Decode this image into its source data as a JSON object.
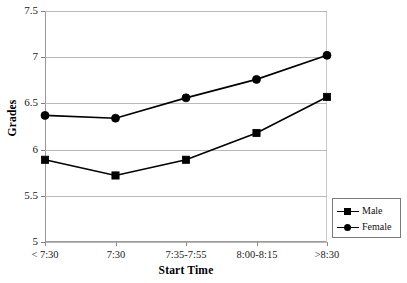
{
  "chart_data": {
    "type": "line",
    "title": "",
    "xlabel": "Start Time",
    "ylabel": "Grades",
    "categories": [
      "< 7:30",
      "7:30",
      "7:35-7:55",
      "8:00-8:15",
      ">8:30"
    ],
    "series": [
      {
        "name": "Male",
        "marker": "square",
        "color": "#000000",
        "values": [
          5.89,
          5.72,
          5.89,
          6.18,
          6.57
        ]
      },
      {
        "name": "Female",
        "marker": "circle",
        "color": "#000000",
        "values": [
          6.37,
          6.34,
          6.56,
          6.76,
          7.02
        ]
      }
    ],
    "ylim": [
      5,
      7.5
    ],
    "yticks": [
      5,
      5.5,
      6,
      6.5,
      7,
      7.5
    ],
    "ytick_labels": [
      "5",
      "5.5",
      "6",
      "6.5",
      "7",
      "7.5"
    ],
    "grid": true,
    "grid_axis": "y",
    "legend_position": "lower-right",
    "legend_entries": [
      "Male",
      "Female"
    ]
  }
}
